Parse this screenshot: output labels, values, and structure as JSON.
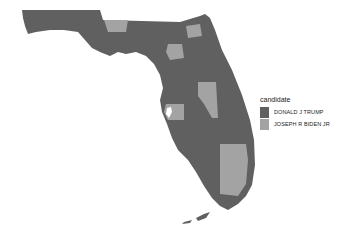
{
  "map": {
    "region": "Florida",
    "unit": "county",
    "fill_by": "candidate",
    "colors": {
      "DONALD J TRUMP": "#606060",
      "JOSEPH R BIDEN JR": "#a3a3a3",
      "background": "#ffffff"
    },
    "highlighted_counties": {
      "JOSEPH R BIDEN JR": [
        "Leon",
        "Gadsden",
        "Alachua",
        "Duval",
        "Orange",
        "Osceola",
        "Pinellas",
        "Hillsborough",
        "Palm Beach",
        "Broward",
        "Miami-Dade"
      ]
    },
    "default_winner": "DONALD J TRUMP"
  },
  "legend": {
    "title": "candidate",
    "items": [
      {
        "label": "DONALD J TRUMP",
        "color": "#606060"
      },
      {
        "label": "JOSEPH R BIDEN JR",
        "color": "#a3a3a3"
      }
    ]
  }
}
